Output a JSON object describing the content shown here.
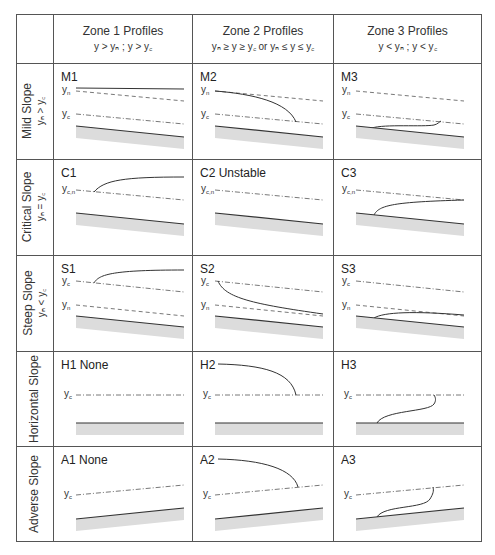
{
  "header": {
    "zones": [
      {
        "title": "Zone 1 Profiles",
        "condition": "y > yₙ ; y > y꜀"
      },
      {
        "title": "Zone 2 Profiles",
        "condition": "yₙ ≥ y ≥ y꜀ or yₙ ≤ y ≤ y꜀"
      },
      {
        "title": "Zone 3 Profiles",
        "condition": "y < yₙ ; y < y꜀"
      }
    ]
  },
  "rows": [
    {
      "label": "Mild Slope",
      "condition": "yₙ > y꜀",
      "cells": [
        {
          "tag": "M1"
        },
        {
          "tag": "M2"
        },
        {
          "tag": "M3"
        }
      ]
    },
    {
      "label": "Critical Slope",
      "condition": "yₙ = y꜀",
      "cells": [
        {
          "tag": "C1"
        },
        {
          "tag": "C2 Unstable"
        },
        {
          "tag": "C3"
        }
      ]
    },
    {
      "label": "Steep Slope",
      "condition": "yₙ < y꜀",
      "cells": [
        {
          "tag": "S1"
        },
        {
          "tag": "S2"
        },
        {
          "tag": "S3"
        }
      ]
    },
    {
      "label": "Horizontal Slope",
      "condition": "",
      "cells": [
        {
          "tag": "H1 None"
        },
        {
          "tag": "H2"
        },
        {
          "tag": "H3"
        }
      ]
    },
    {
      "label": "Adverse Slope",
      "condition": "",
      "cells": [
        {
          "tag": "A1 None"
        },
        {
          "tag": "A2"
        },
        {
          "tag": "A3"
        }
      ]
    }
  ],
  "line_labels": {
    "normal": "yₙ",
    "critical": "y꜀",
    "critical_normal": "y꜀,ₙ"
  },
  "colors": {
    "grid_line": "#555555",
    "bed": "#333333",
    "bed_shade": "#dcdcdc",
    "profile": "#333333",
    "reference_line": "#555555"
  }
}
